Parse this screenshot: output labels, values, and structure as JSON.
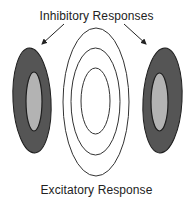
{
  "diagram": {
    "title_top": "Inhibitory Responses",
    "title_bottom": "Excitatory Response",
    "colors": {
      "inhibitory_outer": "#555555",
      "inhibitory_inner": "#b3b3b3",
      "outline": "#1e1e1e",
      "excitatory_line": "#333333",
      "background": "#ffffff"
    },
    "regions": [
      {
        "name": "left-inhibitory-zone",
        "type": "inhibitory"
      },
      {
        "name": "excitatory-center",
        "type": "excitatory",
        "rings": 3
      },
      {
        "name": "right-inhibitory-zone",
        "type": "inhibitory"
      }
    ]
  }
}
